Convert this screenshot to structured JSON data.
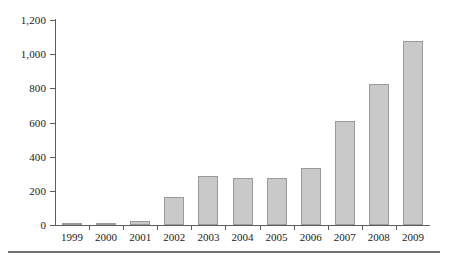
{
  "chart_data": {
    "type": "bar",
    "title": "",
    "subtitle": "",
    "xlabel": "",
    "ylabel": "",
    "categories": [
      "1999",
      "2000",
      "2001",
      "2002",
      "2003",
      "2004",
      "2005",
      "2006",
      "2007",
      "2008",
      "2009"
    ],
    "values": [
      8,
      12,
      22,
      162,
      284,
      274,
      274,
      332,
      610,
      824,
      1076
    ],
    "series": [
      {
        "name": "",
        "values": [
          8,
          12,
          22,
          162,
          284,
          274,
          274,
          332,
          610,
          824,
          1076
        ]
      }
    ],
    "ylim": [
      0,
      1200
    ],
    "ytick_values": [
      0,
      200,
      400,
      600,
      800,
      1000,
      1200
    ],
    "ytick_labels": [
      "0",
      "200",
      "400",
      "600",
      "800",
      "1,000",
      "1,200"
    ],
    "grid": false,
    "legend": null,
    "legend_position": "none",
    "bar_fill_color": "#c9c9c9",
    "bar_border_color": "#9a9a9a",
    "axis_color": "#5d5d5d",
    "background_color": "#ffffff",
    "annotations": []
  },
  "figure": {
    "bottom_rule_color": "#6f6f6f"
  }
}
